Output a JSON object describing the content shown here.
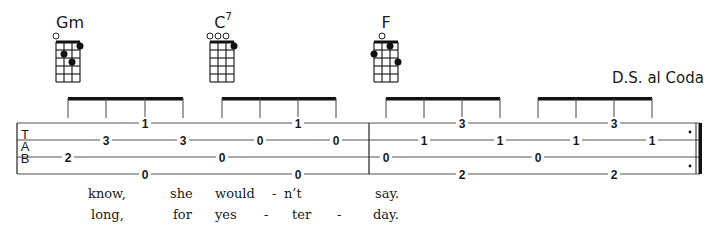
{
  "chords": [
    {
      "name": "Gm",
      "superscript": "",
      "open_strings": [
        0
      ],
      "dots": [
        {
          "string": 3,
          "fret": 1
        },
        {
          "string": 1,
          "fret": 2
        },
        {
          "string": 2,
          "fret": 3
        }
      ]
    },
    {
      "name": "C",
      "superscript": "7",
      "open_strings": [
        0,
        1,
        2
      ],
      "dots": [
        {
          "string": 3,
          "fret": 1
        }
      ]
    },
    {
      "name": "F",
      "superscript": "",
      "open_strings": [
        1
      ],
      "dots": [
        {
          "string": 2,
          "fret": 1
        },
        {
          "string": 0,
          "fret": 2
        },
        {
          "string": 3,
          "fret": 3
        }
      ]
    }
  ],
  "direction": "D.S. al Coda",
  "tab": {
    "clef": [
      "T",
      "A",
      "B"
    ],
    "strings": 4,
    "notes": [
      {
        "x": 68,
        "string": 2,
        "fret": "2"
      },
      {
        "x": 106,
        "string": 1,
        "fret": "3"
      },
      {
        "x": 145,
        "string": 0,
        "fret": "1"
      },
      {
        "x": 145,
        "string": 3,
        "fret": "0"
      },
      {
        "x": 183,
        "string": 1,
        "fret": "3"
      },
      {
        "x": 222,
        "string": 2,
        "fret": "0"
      },
      {
        "x": 260,
        "string": 1,
        "fret": "0"
      },
      {
        "x": 298,
        "string": 0,
        "fret": "1"
      },
      {
        "x": 298,
        "string": 3,
        "fret": "0"
      },
      {
        "x": 336,
        "string": 1,
        "fret": "0"
      },
      {
        "x": 386,
        "string": 2,
        "fret": "0"
      },
      {
        "x": 424,
        "string": 1,
        "fret": "1"
      },
      {
        "x": 462,
        "string": 0,
        "fret": "3"
      },
      {
        "x": 462,
        "string": 3,
        "fret": "2"
      },
      {
        "x": 500,
        "string": 1,
        "fret": "1"
      },
      {
        "x": 538,
        "string": 2,
        "fret": "0"
      },
      {
        "x": 576,
        "string": 1,
        "fret": "1"
      },
      {
        "x": 614,
        "string": 0,
        "fret": "3"
      },
      {
        "x": 614,
        "string": 3,
        "fret": "2"
      },
      {
        "x": 652,
        "string": 1,
        "fret": "1"
      }
    ],
    "beam_groups": [
      [
        68,
        106,
        145,
        183
      ],
      [
        222,
        260,
        298,
        336
      ],
      [
        386,
        424,
        462,
        500
      ],
      [
        538,
        576,
        614,
        652
      ]
    ]
  },
  "lyrics": {
    "verse1": [
      {
        "x": 88,
        "text": "know,"
      },
      {
        "x": 170,
        "text": "she"
      },
      {
        "x": 215,
        "text": "would"
      },
      {
        "x": 272,
        "text": "-"
      },
      {
        "x": 284,
        "text": "n’t"
      },
      {
        "x": 375,
        "text": "say."
      }
    ],
    "verse2": [
      {
        "x": 91,
        "text": "long,"
      },
      {
        "x": 173,
        "text": "for"
      },
      {
        "x": 215,
        "text": "yes"
      },
      {
        "x": 264,
        "text": "-"
      },
      {
        "x": 292,
        "text": "ter"
      },
      {
        "x": 337,
        "text": "-"
      },
      {
        "x": 373,
        "text": "day."
      }
    ]
  }
}
